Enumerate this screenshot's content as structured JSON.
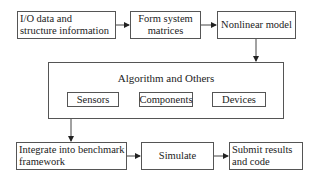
{
  "diagram": {
    "nodes": {
      "io_data": {
        "label": "I/O data and\nstructure information"
      },
      "form_matrices": {
        "label": "Form system\nmatrices"
      },
      "nonlinear_model": {
        "label": "Nonlinear model"
      },
      "algorithm_group": {
        "title": "Algorithm and Others",
        "children": [
          {
            "label": "Sensors"
          },
          {
            "label": "Components"
          },
          {
            "label": "Devices"
          }
        ]
      },
      "integrate": {
        "label": "Integrate into benchmark\nframework"
      },
      "simulate": {
        "label": "Simulate"
      },
      "submit": {
        "label": "Submit results\nand code"
      }
    },
    "edges": [
      {
        "from": "io_data",
        "to": "form_matrices"
      },
      {
        "from": "form_matrices",
        "to": "nonlinear_model"
      },
      {
        "from": "nonlinear_model",
        "to": "algorithm_group"
      },
      {
        "from": "algorithm_group",
        "to": "integrate"
      },
      {
        "from": "integrate",
        "to": "simulate"
      },
      {
        "from": "simulate",
        "to": "submit"
      }
    ],
    "colors": {
      "stroke": "#555555",
      "text": "#222222",
      "background": "#ffffff"
    }
  }
}
